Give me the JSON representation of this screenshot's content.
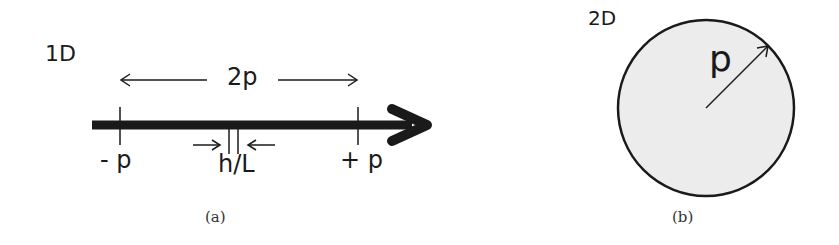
{
  "panel_a": {
    "dimension_label": "1D",
    "span_label": "2p",
    "left_tick_label": "- p",
    "right_tick_label": "+ p",
    "spacing_label": "h/L",
    "caption": "(a)"
  },
  "panel_b": {
    "dimension_label": "2D",
    "radius_label": "p",
    "caption": "(b)"
  },
  "colors": {
    "ink": "#1a1a1a",
    "circle_fill": "#ececec",
    "background": "#ffffff"
  }
}
